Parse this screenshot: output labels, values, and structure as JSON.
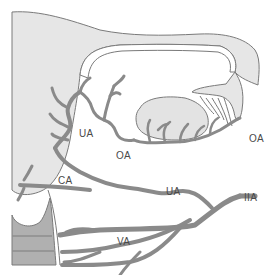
{
  "diagram": {
    "colors": {
      "background": "#ffffff",
      "uterus_fill": "#e6e6e6",
      "cervix_fill": "#b0b0b0",
      "vessel": "#8a8a8a",
      "outline": "#7a7a7a",
      "ovary_fill": "#e3e3e3",
      "label_text": "#4a4a4a"
    },
    "labels": {
      "ua_upper": "UA",
      "oa_left": "OA",
      "oa_right": "OA",
      "ca": "CA",
      "ua_lower": "UA",
      "iia": "IIA",
      "va": "VA"
    },
    "structures": [
      "uterus",
      "fallopian-tube",
      "fimbriae",
      "ovary",
      "cervix",
      "vagina"
    ]
  }
}
